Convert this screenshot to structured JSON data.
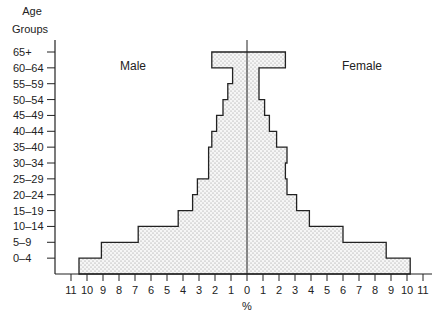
{
  "chart_data": {
    "type": "bar",
    "subtype": "population-pyramid",
    "title": "",
    "ylabel": "Age Groups",
    "xlabel": "%",
    "categories": [
      "0–4",
      "5–9",
      "10–14",
      "15–19",
      "20–24",
      "25–29",
      "30–34",
      "35–40",
      "40–44",
      "45–49",
      "50–54",
      "55–59",
      "60–64",
      "65+"
    ],
    "series": [
      {
        "name": "Male",
        "side": "left",
        "values": [
          10.5,
          9.1,
          6.8,
          4.3,
          3.4,
          3.1,
          2.4,
          2.4,
          2.2,
          1.9,
          1.5,
          1.2,
          0.9,
          2.2
        ]
      },
      {
        "name": "Female",
        "side": "right",
        "values": [
          10.2,
          8.7,
          6.0,
          3.9,
          3.1,
          2.5,
          2.4,
          2.5,
          1.85,
          1.4,
          1.1,
          0.75,
          0.75,
          2.4
        ]
      }
    ],
    "x_ticks_left": [
      11,
      10,
      9,
      8,
      7,
      6,
      5,
      4,
      3,
      2,
      1
    ],
    "x_ticks_right": [
      0,
      1,
      2,
      3,
      4,
      5,
      6,
      7,
      8,
      9,
      10,
      11
    ],
    "xlim": [
      -11.5,
      11.5
    ],
    "grid": false,
    "legend": "inline labels: Male (left), Female (right)",
    "fill": "stippled dots"
  },
  "labels": {
    "y_title_line1": "Age",
    "y_title_line2": "Groups",
    "male": "Male",
    "female": "Female",
    "x_unit": "%"
  },
  "colors": {
    "line": "#222222",
    "fill_bg": "#f4f4f4",
    "dot": "#8a8a8a"
  }
}
